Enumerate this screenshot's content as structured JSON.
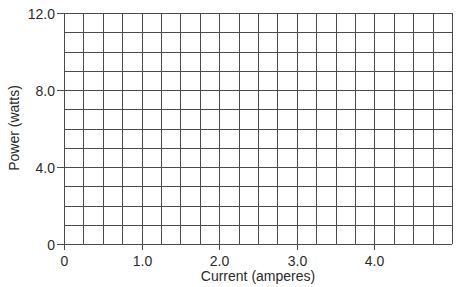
{
  "chart_data": {
    "type": "line",
    "title": "",
    "xlabel": "Current (amperes)",
    "ylabel": "Power (watts)",
    "xlim": [
      0,
      5.0
    ],
    "ylim": [
      0,
      12.0
    ],
    "x_ticks": [
      {
        "value": 0,
        "label": "0"
      },
      {
        "value": 1.0,
        "label": "1.0"
      },
      {
        "value": 2.0,
        "label": "2.0"
      },
      {
        "value": 3.0,
        "label": "3.0"
      },
      {
        "value": 4.0,
        "label": "4.0"
      }
    ],
    "y_ticks": [
      {
        "value": 0,
        "label": "0"
      },
      {
        "value": 4.0,
        "label": "4.0"
      },
      {
        "value": 8.0,
        "label": "8.0"
      },
      {
        "value": 12.0,
        "label": "12.0"
      }
    ],
    "grid": true,
    "grid_x_step": 0.25,
    "grid_y_step": 1.0,
    "series": [],
    "legend": null
  },
  "colors": {
    "grid": "#4a4a4a",
    "text": "#2a2a2a",
    "background": "#ffffff"
  }
}
